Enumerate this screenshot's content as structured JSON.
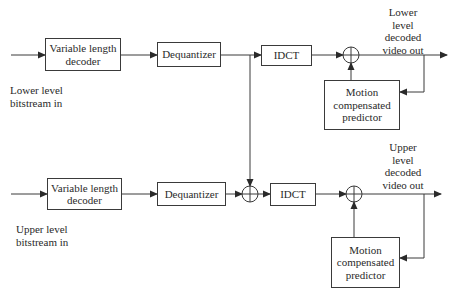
{
  "diagram": {
    "type": "block-diagram",
    "colors": {
      "line": "#3a3a3a",
      "text": "#2a2a2a",
      "background": "#ffffff"
    },
    "lower_path": {
      "input_label_line1": "Lower level",
      "input_label_line2": "bitstream in",
      "vld_line1": "Variable length",
      "vld_line2": "decoder",
      "dequantizer": "Dequantizer",
      "idct": "IDCT",
      "summer": "adder",
      "mcp_line1": "Motion",
      "mcp_line2": "compensated",
      "mcp_line3": "predictor",
      "output_label_line1": "Lower",
      "output_label_line2": "level",
      "output_label_line3": "decoded",
      "output_label_line4": "video out"
    },
    "upper_path": {
      "input_label_line1": "Upper level",
      "input_label_line2": "bitstream in",
      "vld_line1": "Variable length",
      "vld_line2": "decoder",
      "dequantizer": "Dequantizer",
      "idct": "IDCT",
      "mcp_line1": "Motion",
      "mcp_line2": "compensated",
      "mcp_line3": "predictor",
      "output_label_line1": "Upper",
      "output_label_line2": "level",
      "output_label_line3": "decoded",
      "output_label_line4": "video out"
    },
    "connections": [
      "lower-input -> lower-vld",
      "lower-vld -> lower-dequantizer",
      "lower-dequantizer -> lower-idct",
      "lower-dequantizer -> upper-coefficient-adder",
      "lower-idct -> lower-adder",
      "lower-mcp -> lower-adder",
      "lower-adder -> lower-output",
      "lower-output -> lower-mcp",
      "upper-input -> upper-vld",
      "upper-vld -> upper-dequantizer",
      "upper-dequantizer -> upper-coefficient-adder",
      "upper-coefficient-adder -> upper-idct",
      "upper-idct -> upper-adder",
      "upper-mcp -> upper-adder",
      "upper-adder -> upper-output",
      "upper-output -> upper-mcp"
    ]
  }
}
